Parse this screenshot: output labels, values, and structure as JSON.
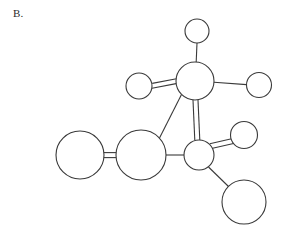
{
  "figure": {
    "label": "B.",
    "caption_text": "B.",
    "background_color": "#ffffff",
    "stroke_color": "#3a3a3a",
    "fill_color": "#ffffff",
    "width": 285,
    "height": 233
  },
  "chart_data": {
    "type": "diagram",
    "title": "B.",
    "subtitle": "",
    "xlabel": "",
    "ylabel": "",
    "diagram_kind": "ball-and-stick molecular structure",
    "grid": false,
    "legend": "none",
    "nodes": [
      {
        "id": "n1",
        "label": "",
        "cx": 197,
        "cy": 31,
        "r": 12.0,
        "size": "small"
      },
      {
        "id": "n2",
        "label": "",
        "cx": 195,
        "cy": 81,
        "r": 19.0,
        "size": "medium"
      },
      {
        "id": "n3",
        "label": "",
        "cx": 139,
        "cy": 86,
        "r": 13.0,
        "size": "small"
      },
      {
        "id": "n4",
        "label": "",
        "cx": 259,
        "cy": 85,
        "r": 12.5,
        "size": "small"
      },
      {
        "id": "n5",
        "label": "",
        "cx": 141,
        "cy": 155,
        "r": 25.0,
        "size": "large"
      },
      {
        "id": "n6",
        "label": "",
        "cx": 80,
        "cy": 155,
        "r": 24.0,
        "size": "large"
      },
      {
        "id": "n7",
        "label": "",
        "cx": 199,
        "cy": 155,
        "r": 15.0,
        "size": "medium"
      },
      {
        "id": "n8",
        "label": "",
        "cx": 244,
        "cy": 135,
        "r": 13.5,
        "size": "small"
      },
      {
        "id": "n9",
        "label": "",
        "cx": 244,
        "cy": 202,
        "r": 22.0,
        "size": "large"
      }
    ],
    "edges": [
      {
        "from": "n2",
        "to": "n1",
        "order": 1,
        "style": "single"
      },
      {
        "from": "n2",
        "to": "n3",
        "order": 2,
        "style": "double"
      },
      {
        "from": "n2",
        "to": "n4",
        "order": 1,
        "style": "single"
      },
      {
        "from": "n2",
        "to": "n5",
        "order": 1,
        "style": "single"
      },
      {
        "from": "n2",
        "to": "n7",
        "order": 2,
        "style": "double"
      },
      {
        "from": "n5",
        "to": "n6",
        "order": 2,
        "style": "double"
      },
      {
        "from": "n5",
        "to": "n7",
        "order": 1,
        "style": "single"
      },
      {
        "from": "n7",
        "to": "n8",
        "order": 2,
        "style": "double"
      },
      {
        "from": "n7",
        "to": "n9",
        "order": 1,
        "style": "single"
      }
    ],
    "node_count": 9,
    "edge_count": 9,
    "double_bond_offset": 2.4,
    "annotations": [
      "B."
    ]
  }
}
